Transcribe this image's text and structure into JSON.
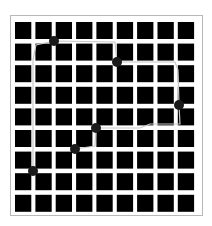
{
  "puzzle": {
    "grid": {
      "rows": 9,
      "cols": 9,
      "origin_x": 15,
      "origin_y": 22,
      "pitch_x": 20.35,
      "pitch_y": 21.6,
      "square_w": 16.3,
      "square_h": 17,
      "square_color": "#000000",
      "gutter_color": "#ffffff",
      "frame_color": "#b8b8b8"
    },
    "dots": [
      {
        "id": 1,
        "x": 54,
        "y": 41
      },
      {
        "id": 2,
        "x": 117,
        "y": 62
      },
      {
        "id": 3,
        "x": 179,
        "y": 105
      },
      {
        "id": 4,
        "x": 96,
        "y": 128
      },
      {
        "id": 5,
        "x": 75,
        "y": 149
      },
      {
        "id": 6,
        "x": 33,
        "y": 171
      }
    ],
    "dot_color": "#1a1a1a",
    "path_color": "#c8c8c8",
    "path_points": [
      [
        33,
        171
      ],
      [
        33,
        60
      ],
      [
        36,
        45
      ],
      [
        54,
        41
      ],
      [
        115,
        42
      ],
      [
        117,
        62
      ],
      [
        175,
        62
      ],
      [
        178,
        70
      ],
      [
        179,
        105
      ],
      [
        180,
        124
      ],
      [
        150,
        124
      ],
      [
        140,
        128
      ],
      [
        96,
        128
      ],
      [
        95,
        146
      ],
      [
        75,
        149
      ]
    ]
  }
}
